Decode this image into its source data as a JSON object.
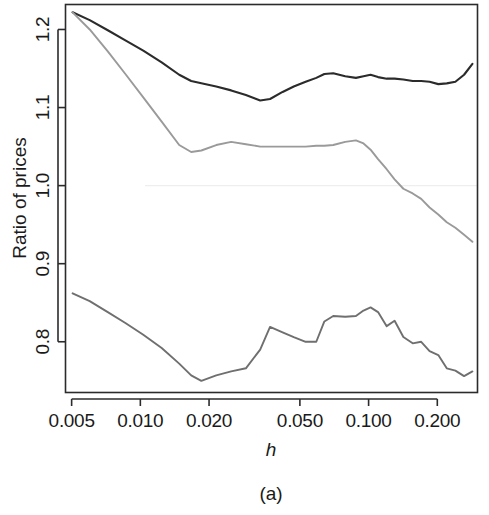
{
  "figure": {
    "caption": "(a)",
    "background_color": "#ffffff"
  },
  "chart_data": {
    "type": "line",
    "title": "",
    "subtitle": "",
    "xlabel": "h",
    "ylabel": "Ratio of prices",
    "xscale": "log",
    "yscale": "linear",
    "xlim": [
      0.0047,
      0.3
    ],
    "ylim": [
      0.735,
      1.232
    ],
    "grid": false,
    "legend": "none",
    "xticks": [
      0.005,
      0.01,
      0.02,
      0.05,
      0.1,
      0.2
    ],
    "xtick_labels": [
      "0.005",
      "0.010",
      "0.020",
      "0.050",
      "0.100",
      "0.200"
    ],
    "yticks": [
      0.8,
      0.9,
      1.0,
      1.1,
      1.2
    ],
    "ytick_labels": [
      "0.8",
      "0.9",
      "1.0",
      "1.1",
      "1.2"
    ],
    "annotations": [
      {
        "kind": "reference-line",
        "orientation": "horizontal",
        "value": 1.0,
        "color": "#eeeeee"
      }
    ],
    "series": [
      {
        "name": "upper-curve",
        "color": "#2b2b2b",
        "width": 2.1,
        "x": [
          0.00505,
          0.006,
          0.0072,
          0.0086,
          0.0103,
          0.0124,
          0.0148,
          0.0167,
          0.0185,
          0.0215,
          0.025,
          0.029,
          0.0335,
          0.037,
          0.042,
          0.047,
          0.053,
          0.059,
          0.064,
          0.07,
          0.079,
          0.088,
          0.095,
          0.102,
          0.11,
          0.12,
          0.13,
          0.142,
          0.156,
          0.17,
          0.185,
          0.202,
          0.22,
          0.24,
          0.262,
          0.285
        ],
        "y": [
          1.222,
          1.212,
          1.199,
          1.186,
          1.173,
          1.158,
          1.142,
          1.134,
          1.131,
          1.127,
          1.122,
          1.116,
          1.109,
          1.111,
          1.12,
          1.127,
          1.133,
          1.138,
          1.143,
          1.144,
          1.14,
          1.138,
          1.14,
          1.142,
          1.139,
          1.137,
          1.137,
          1.136,
          1.134,
          1.134,
          1.133,
          1.13,
          1.131,
          1.133,
          1.142,
          1.156
        ]
      },
      {
        "name": "middle-curve",
        "color": "#9a9a9a",
        "width": 1.9,
        "x": [
          0.00505,
          0.006,
          0.0072,
          0.0086,
          0.0103,
          0.0124,
          0.0148,
          0.0167,
          0.0185,
          0.0215,
          0.025,
          0.029,
          0.0335,
          0.037,
          0.042,
          0.047,
          0.053,
          0.059,
          0.064,
          0.07,
          0.079,
          0.088,
          0.095,
          0.102,
          0.11,
          0.12,
          0.13,
          0.142,
          0.156,
          0.17,
          0.185,
          0.202,
          0.22,
          0.24,
          0.262,
          0.285
        ],
        "y": [
          1.222,
          1.2,
          1.172,
          1.143,
          1.113,
          1.082,
          1.052,
          1.043,
          1.045,
          1.052,
          1.056,
          1.053,
          1.05,
          1.05,
          1.05,
          1.05,
          1.05,
          1.051,
          1.051,
          1.052,
          1.056,
          1.058,
          1.054,
          1.046,
          1.034,
          1.021,
          1.008,
          0.996,
          0.99,
          0.983,
          0.972,
          0.963,
          0.953,
          0.946,
          0.937,
          0.928
        ]
      },
      {
        "name": "lower-curve",
        "color": "#6f6f6f",
        "width": 1.9,
        "x": [
          0.00505,
          0.006,
          0.0072,
          0.0086,
          0.0103,
          0.0124,
          0.0148,
          0.0167,
          0.0185,
          0.0215,
          0.025,
          0.029,
          0.0335,
          0.037,
          0.042,
          0.047,
          0.053,
          0.059,
          0.064,
          0.07,
          0.079,
          0.088,
          0.095,
          0.102,
          0.11,
          0.12,
          0.13,
          0.142,
          0.156,
          0.17,
          0.185,
          0.202,
          0.22,
          0.24,
          0.262,
          0.285
        ],
        "y": [
          0.862,
          0.852,
          0.838,
          0.824,
          0.809,
          0.792,
          0.772,
          0.757,
          0.75,
          0.757,
          0.762,
          0.766,
          0.79,
          0.819,
          0.812,
          0.806,
          0.8,
          0.8,
          0.826,
          0.833,
          0.832,
          0.833,
          0.84,
          0.844,
          0.838,
          0.82,
          0.827,
          0.806,
          0.798,
          0.8,
          0.788,
          0.783,
          0.766,
          0.763,
          0.756,
          0.762
        ]
      }
    ]
  }
}
